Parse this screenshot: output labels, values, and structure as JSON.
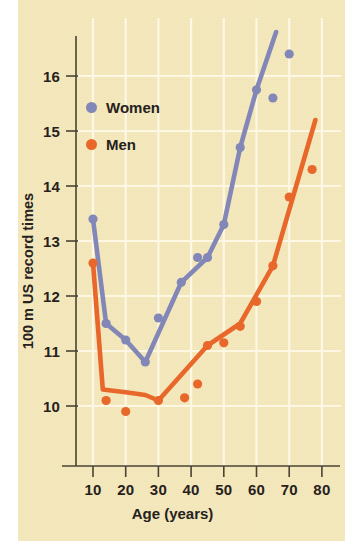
{
  "chart_data": {
    "type": "scatter",
    "title": "",
    "subtitle": "",
    "xlabel": "Age (years)",
    "ylabel": "100 m US record times",
    "xlim": [
      5,
      85
    ],
    "ylim": [
      9.3,
      16.9
    ],
    "xticks": [
      10,
      20,
      30,
      40,
      50,
      60,
      70,
      80
    ],
    "yticks": [
      10,
      11,
      12,
      13,
      14,
      15,
      16
    ],
    "grid": true,
    "legend_position": "upper-left",
    "series": [
      {
        "name": "Women",
        "color": "#8287b8",
        "points": [
          {
            "x": 10,
            "y": 13.4
          },
          {
            "x": 14,
            "y": 11.5
          },
          {
            "x": 20,
            "y": 11.2
          },
          {
            "x": 26,
            "y": 10.8
          },
          {
            "x": 30,
            "y": 11.6
          },
          {
            "x": 37,
            "y": 12.25
          },
          {
            "x": 42,
            "y": 12.7
          },
          {
            "x": 45,
            "y": 12.7
          },
          {
            "x": 50,
            "y": 13.3
          },
          {
            "x": 55,
            "y": 14.7
          },
          {
            "x": 60,
            "y": 15.75
          },
          {
            "x": 65,
            "y": 15.6
          },
          {
            "x": 70,
            "y": 16.4
          }
        ],
        "fit_line": [
          {
            "x": 10,
            "y": 13.4
          },
          {
            "x": 14,
            "y": 11.5
          },
          {
            "x": 20,
            "y": 11.2
          },
          {
            "x": 26,
            "y": 10.8
          },
          {
            "x": 37,
            "y": 12.25
          },
          {
            "x": 45,
            "y": 12.7
          },
          {
            "x": 50,
            "y": 13.3
          },
          {
            "x": 55,
            "y": 14.7
          },
          {
            "x": 60,
            "y": 15.75
          },
          {
            "x": 66,
            "y": 16.8
          }
        ]
      },
      {
        "name": "Men",
        "color": "#e8672a",
        "points": [
          {
            "x": 10,
            "y": 12.6
          },
          {
            "x": 14,
            "y": 10.1
          },
          {
            "x": 20,
            "y": 9.9
          },
          {
            "x": 30,
            "y": 10.1
          },
          {
            "x": 38,
            "y": 10.15
          },
          {
            "x": 42,
            "y": 10.4
          },
          {
            "x": 45,
            "y": 11.1
          },
          {
            "x": 50,
            "y": 11.15
          },
          {
            "x": 55,
            "y": 11.45
          },
          {
            "x": 60,
            "y": 11.9
          },
          {
            "x": 65,
            "y": 12.55
          },
          {
            "x": 70,
            "y": 13.8
          },
          {
            "x": 77,
            "y": 14.3
          }
        ],
        "fit_line": [
          {
            "x": 10,
            "y": 12.6
          },
          {
            "x": 13,
            "y": 10.3
          },
          {
            "x": 20,
            "y": 10.25
          },
          {
            "x": 26,
            "y": 10.2
          },
          {
            "x": 30,
            "y": 10.1
          },
          {
            "x": 45,
            "y": 11.1
          },
          {
            "x": 55,
            "y": 11.5
          },
          {
            "x": 65,
            "y": 12.55
          },
          {
            "x": 78,
            "y": 15.2
          }
        ]
      }
    ],
    "legend": [
      {
        "label": "Women",
        "color": "#8287b8"
      },
      {
        "label": "Men",
        "color": "#e8672a"
      }
    ],
    "colors": {
      "background": "#f4e8bb",
      "gridline": "#fdf7e4",
      "axis": "#4a4333",
      "text": "#26211c",
      "women": "#8287b8",
      "men": "#e8672a"
    }
  },
  "axes": {
    "ytick_labels": [
      "16",
      "15",
      "14",
      "13",
      "12",
      "11",
      "10"
    ],
    "xtick_labels": [
      "10",
      "20",
      "30",
      "40",
      "50",
      "60",
      "70",
      "80"
    ],
    "ylabel": "100 m US record times",
    "xlabel": "Age (years)"
  }
}
